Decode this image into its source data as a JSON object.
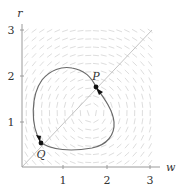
{
  "figure": {
    "type": "phase-portrait",
    "axes": {
      "x_label": "w",
      "y_label": "r",
      "x_ticks": [
        "1",
        "2",
        "3"
      ],
      "y_ticks": [
        "1",
        "2",
        "3"
      ],
      "x_range": [
        0,
        3.05
      ],
      "y_range": [
        0,
        3.05
      ]
    },
    "points": [
      {
        "label": "P",
        "w": 1.75,
        "r": 1.75,
        "arrow": "down-right"
      },
      {
        "label": "Q",
        "w": 0.45,
        "r": 0.55,
        "arrow": "up-left"
      }
    ],
    "diagonal": {
      "from": [
        0,
        0
      ],
      "to": [
        3,
        3
      ],
      "label": "r = w"
    },
    "orbit": "closed clockwise trajectory through P and Q",
    "vector_field": {
      "center": [
        1.6,
        1.2
      ],
      "direction": "clockwise",
      "grid_step": 0.18
    },
    "colors": {
      "axis": "#9a9a9a",
      "orbit": "#6a6a6a",
      "field": "#d4d4d4",
      "diagonal": "#bdbdbd",
      "marker": "#111111"
    }
  }
}
